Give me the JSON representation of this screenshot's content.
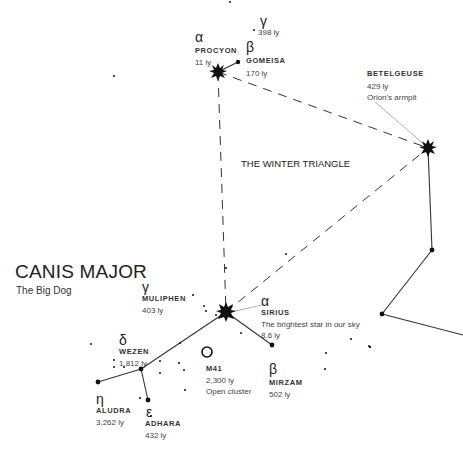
{
  "constellation": {
    "title": "CANIS MAJOR",
    "subtitle": "The Big Dog"
  },
  "asterism": {
    "label": "THE WINTER TRIANGLE"
  },
  "stars": {
    "procyon": {
      "greek": "α",
      "name": "PROCYON",
      "distance": "11 ly"
    },
    "gomeisa": {
      "greek": "β",
      "name": "GOMEISA",
      "distance": "170 ly"
    },
    "gamma_cmi": {
      "greek": "γ",
      "distance": "398 ly"
    },
    "betelgeuse": {
      "name": "BETELGEUSE",
      "distance": "429 ly",
      "note": "Orion's armpit"
    },
    "muliphen": {
      "greek": "γ",
      "name": "MULIPHEN",
      "distance": "403 ly"
    },
    "sirius": {
      "greek": "α",
      "name": "SIRIUS",
      "note": "The brightest star in our sky",
      "distance": "8.6 ly"
    },
    "wezen": {
      "greek": "δ",
      "name": "WEZEN",
      "distance": "1,812 ly"
    },
    "m41": {
      "name": "M41",
      "distance": "2,300 ly",
      "note": "Open cluster"
    },
    "mirzam": {
      "greek": "β",
      "name": "MIRZAM",
      "distance": "502 ly"
    },
    "aludra": {
      "greek": "η",
      "name": "ALUDRA",
      "distance": "3,262 ly"
    },
    "adhara": {
      "greek": "ε",
      "name": "ADHARA",
      "distance": "432 ly"
    }
  },
  "colors": {
    "ink": "#111111",
    "line": "#333333",
    "leader": "#999999",
    "background": "#ffffff"
  }
}
